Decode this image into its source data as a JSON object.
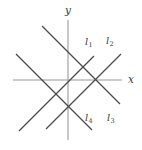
{
  "figure": {
    "background_color": "#ffffff",
    "axis_color": "#9a9a9a",
    "line_color": "#4a4a4a",
    "label_color": "#3a3a3a",
    "axes": {
      "x_label": "x",
      "y_label": "y",
      "origin": {
        "x": 68,
        "y": 80
      },
      "x_axis": {
        "x1": 13,
        "y1": 80,
        "x2": 122,
        "y2": 80
      },
      "y_axis": {
        "x1": 68,
        "y1": 20,
        "x2": 68,
        "y2": 140
      }
    },
    "lines": [
      {
        "id": "l1",
        "label": "l",
        "subscript": "1",
        "slope": 1,
        "label_x": 85,
        "label_y": 37,
        "x1": 19,
        "y1": 131,
        "x2": 94,
        "y2": 56
      },
      {
        "id": "l2",
        "label": "l",
        "subscript": "2",
        "slope": 1,
        "label_x": 106,
        "label_y": 36,
        "x1": 46,
        "y1": 129,
        "x2": 121,
        "y2": 54
      },
      {
        "id": "l3",
        "label": "l",
        "subscript": "3",
        "slope": -1,
        "label_x": 107,
        "label_y": 113,
        "x1": 42,
        "y1": 26,
        "x2": 120,
        "y2": 104
      },
      {
        "id": "l4",
        "label": "l",
        "subscript": "4",
        "slope": -1,
        "label_x": 85,
        "label_y": 113,
        "x1": 16,
        "y1": 54,
        "x2": 92,
        "y2": 130
      }
    ],
    "intersections": [
      {
        "name": "top-vertex",
        "x": 68,
        "y": 52
      },
      {
        "name": "bottom-vertex",
        "x": 68,
        "y": 107
      },
      {
        "name": "left-vertex",
        "x": 42,
        "y": 80
      },
      {
        "name": "right-vertex",
        "x": 95,
        "y": 80
      }
    ]
  }
}
